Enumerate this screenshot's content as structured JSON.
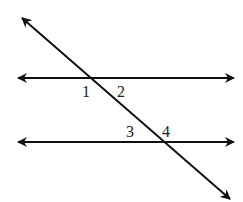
{
  "diagram": {
    "lines": [
      {
        "name": "upper-parallel-line",
        "x1": 18,
        "y1": 78,
        "x2": 234,
        "y2": 78
      },
      {
        "name": "lower-parallel-line",
        "x1": 18,
        "y1": 142,
        "x2": 234,
        "y2": 142
      },
      {
        "name": "transversal",
        "x1": 22,
        "y1": 18,
        "x2": 230,
        "y2": 199
      }
    ],
    "angle_labels": [
      {
        "label": "1",
        "x": 82,
        "y": 86
      },
      {
        "label": "2",
        "x": 117,
        "y": 86
      },
      {
        "label": "3",
        "x": 126,
        "y": 126
      },
      {
        "label": "4",
        "x": 162,
        "y": 126
      }
    ],
    "stroke_color": "#111111"
  }
}
